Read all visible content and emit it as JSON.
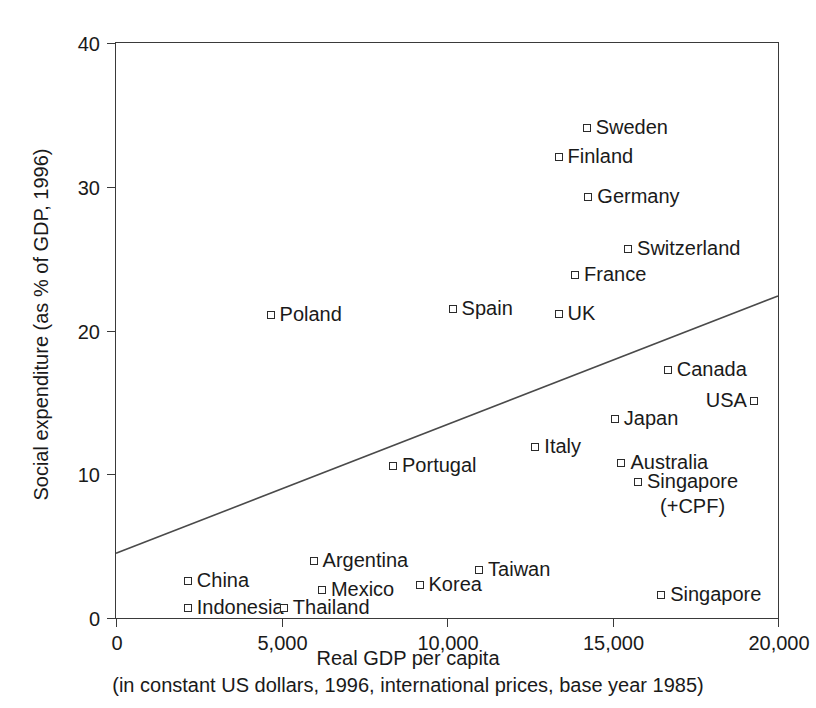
{
  "chart_data": {
    "type": "scatter",
    "title": "",
    "xlabel": "Real GDP per capita",
    "xlabel_sub": "(in constant US dollars, 1996, international prices, base year 1985)",
    "ylabel": "Social expenditure (as % of GDP, 1996)",
    "xlim": [
      0,
      20000
    ],
    "ylim": [
      0,
      40
    ],
    "xticks": [
      0,
      5000,
      10000,
      15000,
      20000
    ],
    "xtick_labels": [
      "0",
      "5,000",
      "10,000",
      "15,000",
      "20,000"
    ],
    "yticks": [
      0,
      10,
      20,
      30,
      40
    ],
    "ytick_labels": [
      "0",
      "10",
      "20",
      "30",
      "40"
    ],
    "grid": false,
    "legend": "none",
    "marker": "open-square",
    "points": [
      {
        "label": "Sweden",
        "x": 14250,
        "y": 34.0,
        "label_side": "right"
      },
      {
        "label": "Finland",
        "x": 13400,
        "y": 32.0,
        "label_side": "right"
      },
      {
        "label": "Germany",
        "x": 14300,
        "y": 29.2,
        "label_side": "right"
      },
      {
        "label": "Switzerland",
        "x": 15500,
        "y": 25.6,
        "label_side": "right"
      },
      {
        "label": "France",
        "x": 13900,
        "y": 23.8,
        "label_side": "right"
      },
      {
        "label": "UK",
        "x": 13400,
        "y": 21.1,
        "label_side": "right"
      },
      {
        "label": "Spain",
        "x": 10200,
        "y": 21.4,
        "label_side": "right"
      },
      {
        "label": "Poland",
        "x": 4700,
        "y": 21.0,
        "label_side": "right"
      },
      {
        "label": "Canada",
        "x": 16700,
        "y": 17.2,
        "label_side": "right"
      },
      {
        "label": "USA",
        "x": 19300,
        "y": 15.0,
        "label_side": "left"
      },
      {
        "label": "Japan",
        "x": 15100,
        "y": 13.8,
        "label_side": "right"
      },
      {
        "label": "Italy",
        "x": 12700,
        "y": 11.8,
        "label_side": "right"
      },
      {
        "label": "Australia",
        "x": 15300,
        "y": 10.7,
        "label_side": "right"
      },
      {
        "label": "Singapore (+CPF)",
        "x": 15800,
        "y": 9.4,
        "label_side": "right",
        "label_line1": "Singapore",
        "label_line2": "(+CPF)"
      },
      {
        "label": "Portugal",
        "x": 8400,
        "y": 10.5,
        "label_side": "right"
      },
      {
        "label": "Argentina",
        "x": 6000,
        "y": 3.9,
        "label_side": "right"
      },
      {
        "label": "Taiwan",
        "x": 11000,
        "y": 3.3,
        "label_side": "right"
      },
      {
        "label": "China",
        "x": 2200,
        "y": 2.5,
        "label_side": "right"
      },
      {
        "label": "Mexico",
        "x": 6250,
        "y": 1.9,
        "label_side": "right"
      },
      {
        "label": "Korea",
        "x": 9200,
        "y": 2.2,
        "label_side": "right"
      },
      {
        "label": "Indonesia",
        "x": 2200,
        "y": 0.6,
        "label_side": "right"
      },
      {
        "label": "Thailand",
        "x": 5100,
        "y": 0.6,
        "label_side": "right"
      },
      {
        "label": "Singapore",
        "x": 16500,
        "y": 1.5,
        "label_side": "right"
      }
    ],
    "trendline": {
      "x0": 0,
      "y0": 4.5,
      "x1": 20000,
      "y1": 22.4,
      "color": "#4a4a4a"
    }
  }
}
